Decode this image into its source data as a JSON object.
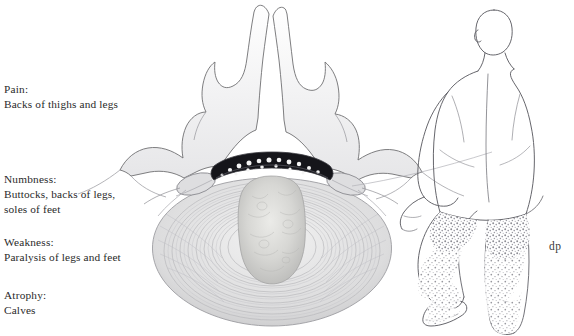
{
  "figure": {
    "background_color": "#ffffff",
    "text_color": "#2a2a2a"
  },
  "labels": [
    {
      "id": "pain",
      "heading": "Pain:",
      "lines": [
        "Backs of thighs and legs"
      ]
    },
    {
      "id": "numbness",
      "heading": "Numbness:",
      "lines": [
        "Buttocks, backs of legs,",
        "soles of feet"
      ]
    },
    {
      "id": "weakness",
      "heading": "Weakness:",
      "lines": [
        "Paralysis of legs and feet"
      ]
    },
    {
      "id": "atrophy",
      "heading": "Atrophy:",
      "lines": [
        "Calves"
      ]
    }
  ],
  "signature": {
    "text": "dp"
  },
  "artwork": {
    "vertebra": {
      "name": "lumbar-vertebra-transverse-section",
      "outline_color": "#6f6f72",
      "shade_color": "#d9d9dc"
    },
    "disc": {
      "name": "herniated-intervertebral-disc",
      "annulus_color": "#c9c9cc",
      "nucleus_color": "#d2d2d0"
    },
    "spinal_canal": {
      "name": "compressed-cauda-equina",
      "fill_color": "#151517",
      "nerve_root_color": "#f2f2f2"
    },
    "nerve_roots": {
      "name": "lateral-nerve-root-ganglia",
      "fill_color": "#dcdcde"
    },
    "body_figure": {
      "name": "posterior-male-figure",
      "outline_color": "#5e5e62",
      "stipple_color": "#8a8a90",
      "view": "posterior",
      "pose": "seated with raised left knee"
    }
  }
}
